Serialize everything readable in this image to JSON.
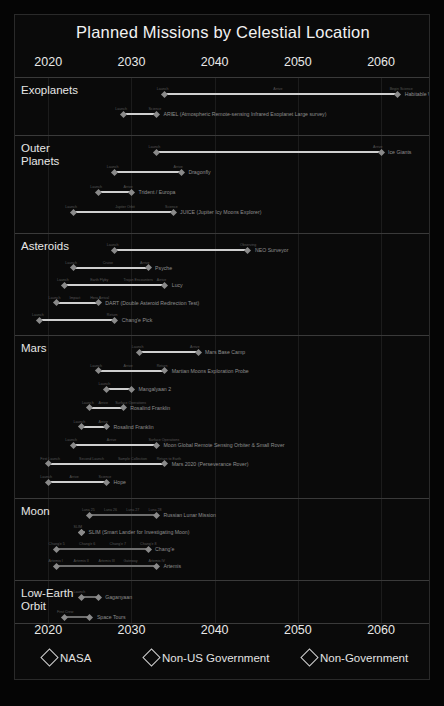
{
  "chart_data": {
    "type": "bar",
    "title": "Planned Missions by Celestial Location",
    "xlabel": "",
    "ylabel": "",
    "xlim": [
      2016,
      2066
    ],
    "grid": true,
    "legend_position": "bottom",
    "axis_ticks": [
      "2020",
      "2030",
      "2040",
      "2050",
      "2060"
    ],
    "axis_tick_values": [
      2020,
      2030,
      2040,
      2050,
      2060
    ],
    "legend": [
      {
        "label": "NASA",
        "marker": "diamond-outline"
      },
      {
        "label": "Non-US Government",
        "marker": "diamond-outline"
      },
      {
        "label": "Non-Government",
        "marker": "diamond-outline"
      }
    ],
    "categories": [
      "Exoplanets",
      "Outer Planets",
      "Asteroids",
      "Mars",
      "Moon",
      "Low-Earth Orbit"
    ],
    "series": [
      {
        "name": "Exoplanets",
        "tasks": [
          {
            "label": "Habitable Worlds Observatory",
            "start": 2034,
            "end": 2062,
            "milestones": [
              "Launch",
              "Arrive",
              "Begin Science"
            ]
          },
          {
            "label": "ARIEL (Atmospheric Remote-sensing Infrared Exoplanet Large survey)",
            "start": 2029,
            "end": 2033,
            "milestones": [
              "Launch",
              "Science"
            ]
          }
        ]
      },
      {
        "name": "Outer Planets",
        "tasks": [
          {
            "label": "Ice Giants",
            "start": 2033,
            "end": 2060,
            "milestones": [
              "Launch",
              "Arrive"
            ]
          },
          {
            "label": "Dragonfly",
            "start": 2028,
            "end": 2036,
            "milestones": [
              "Launch",
              "Arrive"
            ]
          },
          {
            "label": "Trident / Europa",
            "start": 2026,
            "end": 2030,
            "milestones": [
              "Launch",
              "Arrive"
            ]
          },
          {
            "label": "JUICE (Jupiter Icy Moons Explorer)",
            "start": 2023,
            "end": 2035,
            "milestones": [
              "Launch",
              "Jupiter Orbit",
              "Science"
            ]
          }
        ]
      },
      {
        "name": "Asteroids",
        "tasks": [
          {
            "label": "NEO Surveyor",
            "start": 2028,
            "end": 2044,
            "milestones": [
              "Launch",
              "Observing"
            ]
          },
          {
            "label": "Psyche",
            "start": 2023,
            "end": 2032,
            "milestones": [
              "Launch",
              "Cruise",
              "Arrive"
            ]
          },
          {
            "label": "Lucy",
            "start": 2022,
            "end": 2034,
            "milestones": [
              "Launch",
              "Earth Flyby",
              "Trojan Encounters",
              "Arrive"
            ]
          },
          {
            "label": "DART (Double Asteroid Redirection Test)",
            "start": 2021,
            "end": 2026,
            "milestones": [
              "Launch",
              "Impact",
              "Hera Arrival"
            ]
          },
          {
            "label": "Chang'e Pick",
            "start": 2019,
            "end": 2028,
            "milestones": [
              "Launch",
              "Return"
            ]
          }
        ]
      },
      {
        "name": "Mars",
        "tasks": [
          {
            "label": "Mars Base Camp",
            "start": 2031,
            "end": 2038,
            "milestones": [
              "Launch",
              "Arrive"
            ]
          },
          {
            "label": "Martian Moons Exploration Probe",
            "start": 2026,
            "end": 2034,
            "milestones": [
              "Launch",
              "Arrive",
              "Return"
            ]
          },
          {
            "label": "Mangalyaan 2",
            "start": 2027,
            "end": 2030,
            "milestones": [
              "Launch"
            ]
          },
          {
            "label": "Rosalind Franklin",
            "start": 2025,
            "end": 2029,
            "milestones": [
              "Launch",
              "Arrive",
              "Surface Operations"
            ]
          },
          {
            "label": "Rosalind Franklin",
            "start": 2024,
            "end": 2027,
            "milestones": [
              "Launch",
              "Arrive"
            ]
          },
          {
            "label": "Moon Global Remote Sensing Orbiter & Small Rover",
            "start": 2023,
            "end": 2033,
            "milestones": [
              "Launch",
              "Arrive",
              "Surface Operations"
            ]
          },
          {
            "label": "Mars 2020 (Perseverance Rover)",
            "start": 2020,
            "end": 2034,
            "milestones": [
              "First Launch",
              "Second Launch",
              "Sample Collection",
              "Return to Earth"
            ]
          },
          {
            "label": "Hope",
            "start": 2020,
            "end": 2027,
            "milestones": [
              "Launch",
              "Arrive",
              "Science"
            ]
          }
        ]
      },
      {
        "name": "Moon",
        "tasks": [
          {
            "label": "Russian Lunar Mission",
            "start": 2025,
            "end": 2033,
            "milestones": [
              "Luna 25",
              "Luna 26",
              "Luna 27",
              "Luna 28"
            ]
          },
          {
            "label": "SLIM (Smart Lander for Investigating Moon)",
            "start": 2024,
            "end": 2024,
            "milestones": [
              "SLIM"
            ]
          },
          {
            "label": "Chang'e",
            "start": 2021,
            "end": 2032,
            "milestones": [
              "Chang'e 5",
              "Chang'e 6",
              "Chang'e 7",
              "Chang'e 8"
            ]
          },
          {
            "label": "Artemis",
            "start": 2021,
            "end": 2033,
            "milestones": [
              "Artemis I",
              "Artemis II",
              "Artemis III",
              "Gateway",
              "Artemis IV"
            ]
          }
        ]
      },
      {
        "name": "Low-Earth Orbit",
        "tasks": [
          {
            "label": "Gaganyaan",
            "start": 2024,
            "end": 2026,
            "milestones": [
              "Launch"
            ]
          },
          {
            "label": "Space Tours",
            "start": 2022,
            "end": 2025,
            "milestones": [
              "First Crew"
            ]
          }
        ]
      }
    ]
  },
  "colors": {
    "background": "#000000",
    "panel": "#0a0a0a",
    "bar": "#cfcfcf",
    "text": "#e6e6e6",
    "muted": "#8e8e8e",
    "grid": "#1c1c1c",
    "rule": "#3a3a3a"
  }
}
